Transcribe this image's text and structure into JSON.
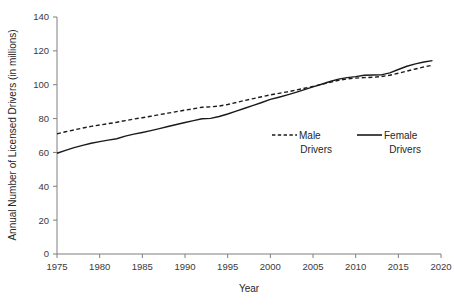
{
  "chart_data": {
    "type": "line",
    "title": "",
    "xlabel": "Year",
    "ylabel": "Annual Number of Licensed Drivers (in millions)",
    "xlim": [
      1975,
      2020
    ],
    "ylim": [
      0,
      140
    ],
    "grid": false,
    "legend_position": "inside-right",
    "x_ticks": [
      "1975",
      "1980",
      "1985",
      "1990",
      "1995",
      "2000",
      "2005",
      "2010",
      "2015",
      "2020"
    ],
    "y_ticks": [
      "0",
      "20",
      "40",
      "60",
      "80",
      "100",
      "120",
      "140"
    ],
    "x": [
      1975,
      1976,
      1977,
      1978,
      1979,
      1980,
      1981,
      1982,
      1983,
      1984,
      1985,
      1986,
      1987,
      1988,
      1989,
      1990,
      1991,
      1992,
      1993,
      1994,
      1995,
      1996,
      1997,
      1998,
      1999,
      2000,
      2001,
      2002,
      2003,
      2004,
      2005,
      2006,
      2007,
      2008,
      2009,
      2010,
      2011,
      2012,
      2013,
      2014,
      2015,
      2016,
      2017,
      2018,
      2019
    ],
    "series": [
      {
        "name": "Male Drivers",
        "style": "dashed",
        "values": [
          71.0,
          72.2,
          73.3,
          74.4,
          75.4,
          76.2,
          77.0,
          77.8,
          78.8,
          79.7,
          80.5,
          81.4,
          82.3,
          83.2,
          84.1,
          85.0,
          85.8,
          86.7,
          86.9,
          87.4,
          88.3,
          89.5,
          90.7,
          91.8,
          92.9,
          94.0,
          94.9,
          95.8,
          96.8,
          97.9,
          99.0,
          100.2,
          101.4,
          102.6,
          103.4,
          103.9,
          104.2,
          104.4,
          104.8,
          105.6,
          106.8,
          108.0,
          109.3,
          110.5,
          111.5
        ]
      },
      {
        "name": "Female Drivers",
        "style": "solid",
        "values": [
          59.5,
          61.2,
          62.8,
          64.2,
          65.4,
          66.4,
          67.3,
          68.1,
          69.6,
          70.8,
          71.8,
          72.9,
          74.1,
          75.3,
          76.5,
          77.7,
          78.8,
          79.9,
          80.1,
          81.2,
          82.7,
          84.4,
          86.1,
          87.8,
          89.5,
          91.3,
          92.6,
          94.0,
          95.5,
          97.1,
          98.7,
          100.3,
          101.9,
          103.3,
          104.2,
          104.8,
          105.6,
          105.7,
          105.8,
          107.0,
          109.0,
          110.9,
          112.3,
          113.4,
          114.2
        ]
      }
    ],
    "legend": [
      {
        "label_line1": "Male",
        "label_line2": "Drivers",
        "style": "dashed"
      },
      {
        "label_line1": "Female",
        "label_line2": "Drivers",
        "style": "solid"
      }
    ],
    "colors": {
      "series_line": "#1a1a1a",
      "axis": "#7f7f7f",
      "text": "#262626",
      "background": "#ffffff"
    }
  }
}
